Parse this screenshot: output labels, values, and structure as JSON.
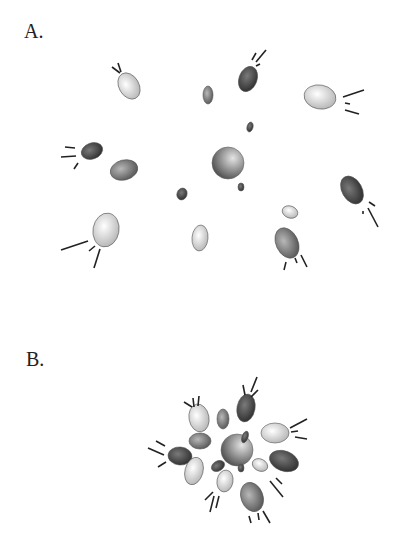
{
  "labels": {
    "a": {
      "text": "A.",
      "x": 24,
      "y": 38
    },
    "b": {
      "text": "B.",
      "x": 26,
      "y": 366
    }
  },
  "colors": {
    "light": "#d8d8d8",
    "mid": "#8a8a8a",
    "dark": "#4a4a4a",
    "stroke": "#555555",
    "line": "#222222"
  },
  "panel_a": {
    "center": {
      "cx": 228,
      "cy": 163,
      "r": 16
    },
    "particles": [
      {
        "cx": 129,
        "cy": 86,
        "rx": 10,
        "ry": 14,
        "rot": -30,
        "shade": "light",
        "lines": [
          [
            112,
            67,
            120,
            73
          ],
          [
            118,
            63,
            121,
            72
          ]
        ]
      },
      {
        "cx": 208,
        "cy": 95,
        "rx": 5,
        "ry": 9,
        "rot": 0,
        "shade": "mid",
        "lines": []
      },
      {
        "cx": 248,
        "cy": 79,
        "rx": 9,
        "ry": 13,
        "rot": 20,
        "shade": "dark",
        "lines": [
          [
            252,
            60,
            256,
            53
          ],
          [
            256,
            62,
            266,
            50
          ],
          [
            256,
            66,
            260,
            64
          ]
        ]
      },
      {
        "cx": 320,
        "cy": 97,
        "rx": 16,
        "ry": 12,
        "rot": 10,
        "shade": "light",
        "lines": [
          [
            343,
            97,
            364,
            90
          ],
          [
            345,
            103,
            350,
            104
          ],
          [
            345,
            110,
            359,
            114
          ]
        ]
      },
      {
        "cx": 250,
        "cy": 127,
        "rx": 3,
        "ry": 5,
        "rot": 15,
        "shade": "dark",
        "lines": []
      },
      {
        "cx": 92,
        "cy": 151,
        "rx": 11,
        "ry": 8,
        "rot": -20,
        "shade": "dark",
        "lines": [
          [
            65,
            147,
            75,
            148
          ],
          [
            61,
            157,
            76,
            156
          ],
          [
            78,
            163,
            74,
            169
          ]
        ]
      },
      {
        "cx": 124,
        "cy": 170,
        "rx": 14,
        "ry": 10,
        "rot": -15,
        "shade": "mid",
        "lines": []
      },
      {
        "cx": 182,
        "cy": 194,
        "rx": 5,
        "ry": 6,
        "rot": 20,
        "shade": "dark",
        "lines": []
      },
      {
        "cx": 241,
        "cy": 187,
        "rx": 3,
        "ry": 4,
        "rot": 0,
        "shade": "dark",
        "lines": []
      },
      {
        "cx": 352,
        "cy": 190,
        "rx": 10,
        "ry": 15,
        "rot": -30,
        "shade": "dark",
        "lines": [
          [
            369,
            202,
            375,
            206
          ],
          [
            363,
            211,
            363,
            214
          ],
          [
            368,
            208,
            378,
            227
          ]
        ]
      },
      {
        "cx": 290,
        "cy": 212,
        "rx": 8,
        "ry": 6,
        "rot": 20,
        "shade": "light",
        "lines": []
      },
      {
        "cx": 106,
        "cy": 230,
        "rx": 13,
        "ry": 17,
        "rot": 10,
        "shade": "light",
        "lines": [
          [
            61,
            250,
            88,
            241
          ],
          [
            89,
            251,
            95,
            246
          ],
          [
            100,
            249,
            94,
            268
          ]
        ]
      },
      {
        "cx": 200,
        "cy": 238,
        "rx": 8,
        "ry": 13,
        "rot": 5,
        "shade": "light",
        "lines": []
      },
      {
        "cx": 287,
        "cy": 243,
        "rx": 11,
        "ry": 16,
        "rot": -25,
        "shade": "mid",
        "lines": [
          [
            286,
            262,
            284,
            270
          ],
          [
            295,
            258,
            297,
            263
          ],
          [
            301,
            255,
            307,
            267
          ]
        ]
      }
    ]
  },
  "panel_b": {
    "center": {
      "cx": 237,
      "cy": 450,
      "r": 16
    },
    "particles": [
      {
        "cx": 199,
        "cy": 418,
        "rx": 10,
        "ry": 14,
        "rot": -10,
        "shade": "light",
        "lines": [
          [
            184,
            402,
            192,
            407
          ],
          [
            193,
            398,
            194,
            407
          ],
          [
            199,
            396,
            198,
            406
          ]
        ]
      },
      {
        "cx": 223,
        "cy": 419,
        "rx": 6,
        "ry": 10,
        "rot": 0,
        "shade": "mid",
        "lines": []
      },
      {
        "cx": 246,
        "cy": 408,
        "rx": 9,
        "ry": 14,
        "rot": 10,
        "shade": "dark",
        "lines": [
          [
            243,
            385,
            245,
            395
          ],
          [
            251,
            392,
            257,
            377
          ],
          [
            251,
            397,
            258,
            390
          ]
        ]
      },
      {
        "cx": 275,
        "cy": 433,
        "rx": 14,
        "ry": 10,
        "rot": 0,
        "shade": "light",
        "lines": [
          [
            290,
            428,
            307,
            419
          ],
          [
            291,
            432,
            298,
            431
          ],
          [
            295,
            437,
            307,
            439
          ]
        ]
      },
      {
        "cx": 245,
        "cy": 437,
        "rx": 3,
        "ry": 6,
        "rot": 20,
        "shade": "dark",
        "lines": []
      },
      {
        "cx": 200,
        "cy": 441,
        "rx": 11,
        "ry": 8,
        "rot": 0,
        "shade": "mid",
        "lines": []
      },
      {
        "cx": 180,
        "cy": 456,
        "rx": 12,
        "ry": 9,
        "rot": 5,
        "shade": "dark",
        "lines": [
          [
            156,
            441,
            165,
            446
          ],
          [
            148,
            448,
            164,
            455
          ],
          [
            158,
            467,
            166,
            462
          ]
        ]
      },
      {
        "cx": 284,
        "cy": 461,
        "rx": 15,
        "ry": 10,
        "rot": 20,
        "shade": "dark",
        "lines": []
      },
      {
        "cx": 218,
        "cy": 466,
        "rx": 7,
        "ry": 5,
        "rot": -30,
        "shade": "dark",
        "lines": []
      },
      {
        "cx": 241,
        "cy": 468,
        "rx": 3,
        "ry": 4,
        "rot": 0,
        "shade": "dark",
        "lines": []
      },
      {
        "cx": 260,
        "cy": 465,
        "rx": 8,
        "ry": 6,
        "rot": 25,
        "shade": "light",
        "lines": [
          [
            276,
            478,
            282,
            484
          ],
          [
            270,
            481,
            283,
            497
          ]
        ]
      },
      {
        "cx": 194,
        "cy": 471,
        "rx": 9,
        "ry": 14,
        "rot": 15,
        "shade": "light",
        "lines": []
      },
      {
        "cx": 225,
        "cy": 481,
        "rx": 8,
        "ry": 11,
        "rot": 10,
        "shade": "light",
        "lines": [
          [
            205,
            500,
            213,
            492
          ],
          [
            214,
            496,
            210,
            512
          ],
          [
            219,
            496,
            216,
            508
          ]
        ]
      },
      {
        "cx": 252,
        "cy": 497,
        "rx": 11,
        "ry": 15,
        "rot": -20,
        "shade": "mid",
        "lines": [
          [
            249,
            516,
            251,
            523
          ],
          [
            258,
            513,
            259,
            520
          ],
          [
            263,
            511,
            270,
            523
          ]
        ]
      }
    ]
  }
}
